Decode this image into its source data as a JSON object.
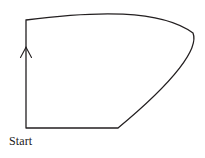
{
  "diagram": {
    "background_color": "#ffffff",
    "stroke_color": "#231f20",
    "stroke_width": 1.3,
    "labels": {
      "start": "Start"
    },
    "label_positions": {
      "start": {
        "x": 9,
        "y": 134
      }
    },
    "arrow": {
      "name": "direction-arrow",
      "direction": "up",
      "tip": {
        "x": 26,
        "y": 47
      },
      "left_barb": {
        "x": 20.5,
        "y": 57
      },
      "right_barb": {
        "x": 31.5,
        "y": 57
      }
    },
    "vertices": {
      "bottom_left": {
        "x": 26,
        "y": 128
      },
      "top_left": {
        "x": 26,
        "y": 20
      },
      "rightmost": {
        "x": 193,
        "y": 33
      },
      "bottom_curve_join": {
        "x": 118,
        "y": 128
      }
    },
    "segments": [
      {
        "name": "left-edge",
        "type": "line",
        "from": {
          "x": 26,
          "y": 128
        },
        "to": {
          "x": 26,
          "y": 20
        }
      },
      {
        "name": "top-edge",
        "type": "curve",
        "from": {
          "x": 26,
          "y": 20
        },
        "control1": {
          "x": 95,
          "y": 11
        },
        "control2": {
          "x": 160,
          "y": 9
        },
        "to": {
          "x": 193,
          "y": 33
        }
      },
      {
        "name": "right-curve",
        "type": "curve",
        "from": {
          "x": 193,
          "y": 33
        },
        "control1": {
          "x": 199,
          "y": 48
        },
        "control2": {
          "x": 176,
          "y": 80
        },
        "to": {
          "x": 118,
          "y": 128
        }
      },
      {
        "name": "bottom-edge",
        "type": "line",
        "from": {
          "x": 118,
          "y": 128
        },
        "to": {
          "x": 26,
          "y": 128
        }
      }
    ],
    "path_d": "M 26 128 L 26 20 C 95 11, 160 9, 193 33 C 199 48, 176 80, 118 128 L 26 128"
  }
}
